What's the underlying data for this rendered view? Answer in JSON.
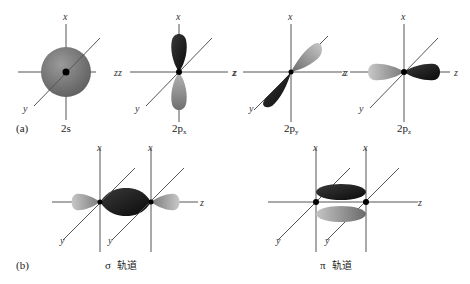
{
  "figure": {
    "panel_a": {
      "label": "(a)",
      "orbitals": [
        {
          "name": "2s",
          "caption_main": "2s",
          "caption_sub": ""
        },
        {
          "name": "2px",
          "caption_main": "2p",
          "caption_sub": "x"
        },
        {
          "name": "2py",
          "caption_main": "2p",
          "caption_sub": "y"
        },
        {
          "name": "2pz",
          "caption_main": "2p",
          "caption_sub": "z"
        }
      ]
    },
    "panel_b": {
      "label": "(b)",
      "sigma": {
        "symbol": "σ",
        "text": "轨道"
      },
      "pi": {
        "symbol": "π",
        "text": "轨道"
      }
    },
    "axes": {
      "x": "x",
      "y": "y",
      "z": "z"
    },
    "colors": {
      "dark_lobe": "#151515",
      "light_lobe": "#9a9a9a",
      "sphere": "#7a7a7a",
      "axis": "#555555"
    }
  }
}
